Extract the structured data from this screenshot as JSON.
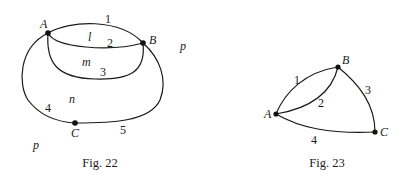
{
  "figures": [
    {
      "caption": "Fig. 22",
      "vertices": [
        {
          "id": "A",
          "label": "A"
        },
        {
          "id": "B",
          "label": "B"
        },
        {
          "id": "C",
          "label": "C"
        }
      ],
      "edges": [
        {
          "id": "1",
          "label": "1",
          "from": "A",
          "to": "B"
        },
        {
          "id": "2",
          "label": "2",
          "from": "A",
          "to": "B"
        },
        {
          "id": "3",
          "label": "3",
          "from": "A",
          "to": "B"
        },
        {
          "id": "4",
          "label": "4",
          "from": "A",
          "to": "C"
        },
        {
          "id": "5",
          "label": "5",
          "from": "C",
          "to": "B"
        }
      ],
      "regions": [
        {
          "id": "l",
          "label": "l"
        },
        {
          "id": "m",
          "label": "m"
        },
        {
          "id": "n",
          "label": "n"
        },
        {
          "id": "p1",
          "label": "p"
        },
        {
          "id": "p2",
          "label": "p"
        }
      ]
    },
    {
      "caption": "Fig. 23",
      "vertices": [
        {
          "id": "A",
          "label": "A"
        },
        {
          "id": "B",
          "label": "B"
        },
        {
          "id": "C",
          "label": "C"
        }
      ],
      "edges": [
        {
          "id": "1",
          "label": "1",
          "from": "A",
          "to": "B"
        },
        {
          "id": "2",
          "label": "2",
          "from": "A",
          "to": "B"
        },
        {
          "id": "3",
          "label": "3",
          "from": "B",
          "to": "C"
        },
        {
          "id": "4",
          "label": "4",
          "from": "A",
          "to": "C"
        }
      ]
    }
  ]
}
